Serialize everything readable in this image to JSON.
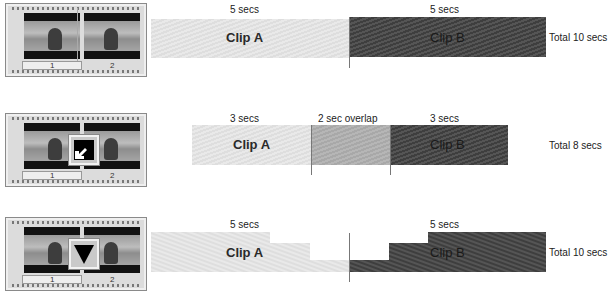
{
  "rows": [
    {
      "id": "cut",
      "filmstrip": {
        "frames": [
          "1",
          "2"
        ],
        "transition_icon": "none"
      },
      "clip_a": {
        "label": "Clip A",
        "duration": "5 secs"
      },
      "clip_b": {
        "label": "Clip B",
        "duration": "5 secs"
      },
      "total": "Total 10 secs"
    },
    {
      "id": "overlap",
      "filmstrip": {
        "frames": [
          "1",
          "2"
        ],
        "transition_icon": "overlap-transition-icon"
      },
      "clip_a": {
        "label": "Clip A",
        "duration": "3 secs"
      },
      "overlap": {
        "label": "2 sec overlap"
      },
      "clip_b": {
        "label": "Clip B",
        "duration": "3 secs"
      },
      "total": "Total 8 secs"
    },
    {
      "id": "fade",
      "filmstrip": {
        "frames": [
          "1",
          "2"
        ],
        "transition_icon": "fade-down-triangle-icon"
      },
      "clip_a": {
        "label": "Clip A",
        "duration": "5 secs"
      },
      "clip_b": {
        "label": "Clip B",
        "duration": "5 secs"
      },
      "total": "Total 10 secs"
    }
  ],
  "colors": {
    "clip_a": "#e4e4e4",
    "clip_b": "#4a4a4a",
    "overlap": "#afafaf",
    "divider": "#777777"
  }
}
